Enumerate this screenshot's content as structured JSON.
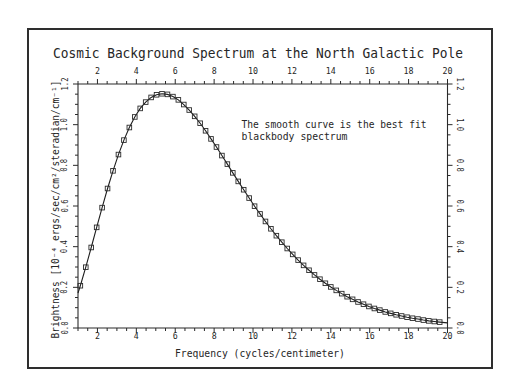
{
  "chart_data": {
    "type": "scatter",
    "title": "Cosmic Background Spectrum at the North Galactic Pole",
    "xlabel": "Frequency (cycles/centimeter)",
    "ylabel": "Brightness [10⁻⁴ ergs/sec/cm²/steradian/cm⁻¹]",
    "xlim": [
      1,
      20
    ],
    "ylim": [
      0,
      1.2
    ],
    "grid": false,
    "legend": null,
    "xticks": [
      2,
      4,
      6,
      8,
      10,
      12,
      14,
      16,
      18,
      20
    ],
    "xtick_labels": [
      "2",
      "4",
      "6",
      "8",
      "10",
      "12",
      "14",
      "16",
      "18",
      "20"
    ],
    "xtick_minor_step": 0.5,
    "yticks": [
      0.0,
      0.2,
      0.4,
      0.6,
      0.8,
      1.0,
      1.2
    ],
    "ytick_labels": [
      "0.0",
      "0.2",
      "0.4",
      "0.6",
      "0.8",
      "1.0",
      "1.2"
    ],
    "ytick_minor_step": 0.05,
    "axes_mirrored": true,
    "annotation": {
      "lines": [
        "The smooth curve is the best fit",
        "blackbody spectrum"
      ],
      "x": 8.5,
      "y": 1.0
    },
    "series": [
      {
        "name": "Measured brightness",
        "style": "square-markers",
        "x": [
          1.12,
          1.4,
          1.68,
          1.96,
          2.24,
          2.52,
          2.8,
          3.08,
          3.36,
          3.64,
          3.92,
          4.2,
          4.48,
          4.76,
          5.04,
          5.32,
          5.6,
          5.88,
          6.16,
          6.44,
          6.72,
          7.0,
          7.28,
          7.56,
          7.84,
          8.12,
          8.4,
          8.68,
          8.96,
          9.24,
          9.52,
          9.8,
          10.08,
          10.36,
          10.64,
          10.92,
          11.2,
          11.48,
          11.76,
          12.04,
          12.32,
          12.6,
          12.88,
          13.16,
          13.44,
          13.72,
          14.0,
          14.28,
          14.56,
          14.84,
          15.12,
          15.4,
          15.68,
          15.96,
          16.24,
          16.52,
          16.8,
          17.08,
          17.36,
          17.64,
          17.92,
          18.2,
          18.48,
          18.76,
          19.04,
          19.32,
          19.6
        ],
        "values": [
          0.208,
          0.299,
          0.396,
          0.495,
          0.592,
          0.686,
          0.773,
          0.853,
          0.924,
          0.986,
          1.038,
          1.08,
          1.111,
          1.134,
          1.147,
          1.152,
          1.149,
          1.138,
          1.122,
          1.099,
          1.072,
          1.041,
          1.007,
          0.97,
          0.93,
          0.89,
          0.848,
          0.806,
          0.763,
          0.721,
          0.68,
          0.639,
          0.599,
          0.561,
          0.524,
          0.488,
          0.454,
          0.422,
          0.391,
          0.362,
          0.334,
          0.308,
          0.284,
          0.261,
          0.24,
          0.22,
          0.202,
          0.185,
          0.169,
          0.154,
          0.141,
          0.128,
          0.117,
          0.106,
          0.096,
          0.088,
          0.079,
          0.072,
          0.065,
          0.059,
          0.053,
          0.048,
          0.044,
          0.039,
          0.035,
          0.032,
          0.029
        ]
      },
      {
        "name": "Best fit blackbody spectrum",
        "style": "smooth-line",
        "x": [
          1.0,
          1.12,
          1.4,
          1.68,
          1.96,
          2.24,
          2.52,
          2.8,
          3.08,
          3.36,
          3.64,
          3.92,
          4.2,
          4.48,
          4.76,
          5.04,
          5.32,
          5.6,
          5.88,
          6.16,
          6.44,
          6.72,
          7.0,
          7.28,
          7.56,
          7.84,
          8.12,
          8.4,
          8.68,
          8.96,
          9.24,
          9.52,
          9.8,
          10.08,
          10.36,
          10.64,
          10.92,
          11.2,
          11.48,
          11.76,
          12.04,
          12.32,
          12.6,
          12.88,
          13.16,
          13.44,
          13.72,
          14.0,
          14.28,
          14.56,
          14.84,
          15.12,
          15.4,
          15.68,
          15.96,
          16.24,
          16.52,
          16.8,
          17.08,
          17.36,
          17.64,
          17.92,
          18.2,
          18.48,
          18.76,
          19.04,
          19.32,
          19.6,
          20.0
        ],
        "values": [
          0.172,
          0.208,
          0.299,
          0.396,
          0.495,
          0.592,
          0.686,
          0.773,
          0.853,
          0.924,
          0.986,
          1.038,
          1.08,
          1.111,
          1.134,
          1.147,
          1.152,
          1.149,
          1.138,
          1.122,
          1.099,
          1.072,
          1.041,
          1.007,
          0.97,
          0.93,
          0.89,
          0.848,
          0.806,
          0.763,
          0.721,
          0.68,
          0.639,
          0.599,
          0.561,
          0.524,
          0.488,
          0.454,
          0.422,
          0.391,
          0.362,
          0.334,
          0.308,
          0.284,
          0.261,
          0.24,
          0.22,
          0.202,
          0.185,
          0.169,
          0.154,
          0.141,
          0.128,
          0.117,
          0.106,
          0.096,
          0.088,
          0.079,
          0.072,
          0.065,
          0.059,
          0.053,
          0.048,
          0.044,
          0.039,
          0.035,
          0.032,
          0.029,
          0.025
        ]
      }
    ]
  },
  "colors": {
    "background": "#ffffff",
    "ink": "#262626",
    "frame": "#2e2e2e"
  }
}
